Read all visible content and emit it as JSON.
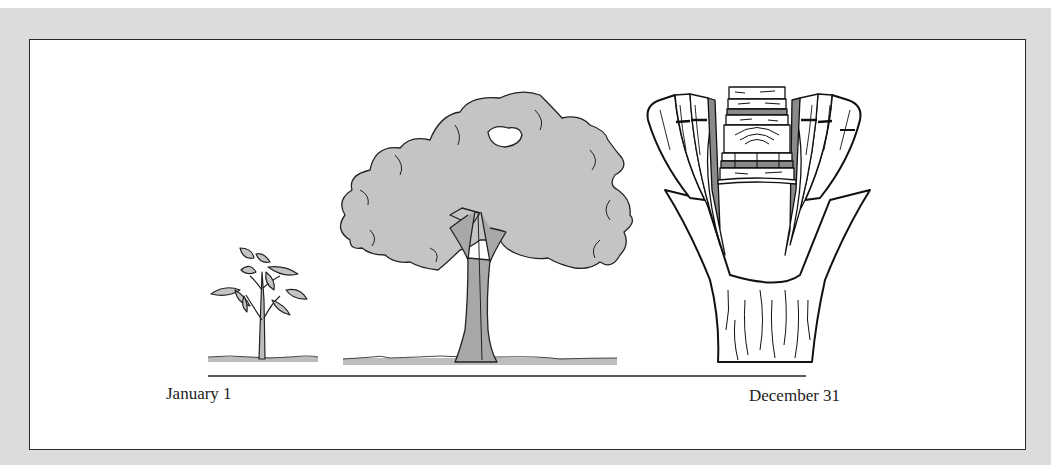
{
  "figure": {
    "timeline": {
      "start_label": "January 1",
      "end_label": "December 31"
    },
    "stages": [
      {
        "name": "seedling",
        "icon": "seedling-icon"
      },
      {
        "name": "mature-tree",
        "icon": "tree-icon"
      },
      {
        "name": "trunk-cross-section",
        "icon": "wood-cross-section-icon"
      }
    ],
    "colors": {
      "panel_bg": "#dcdcdc",
      "box_bg": "#ffffff",
      "border": "#2a2a2a",
      "fill_gray": "#c4c4c4",
      "dark_gray": "#8a8a8a"
    }
  }
}
